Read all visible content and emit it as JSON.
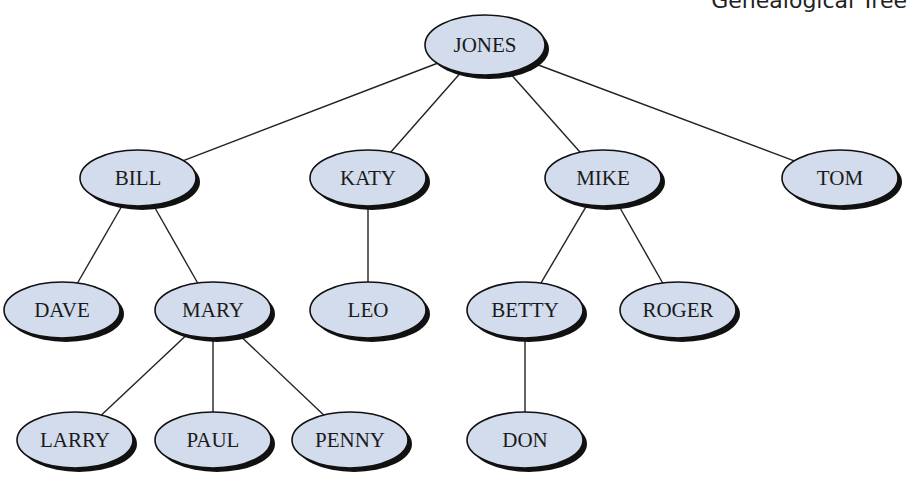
{
  "caption": "Genealogical Tree",
  "style": {
    "node_fill": "#d3dcec",
    "node_stroke": "#111111",
    "shadow": "#111111",
    "edge": "#222222"
  },
  "nodes": [
    {
      "id": "jones",
      "label": "JONES",
      "x": 485,
      "y": 45,
      "rx": 60,
      "ry": 30
    },
    {
      "id": "bill",
      "label": "BILL",
      "x": 138,
      "y": 178,
      "rx": 58,
      "ry": 28
    },
    {
      "id": "katy",
      "label": "KATY",
      "x": 368,
      "y": 178,
      "rx": 58,
      "ry": 28
    },
    {
      "id": "mike",
      "label": "MIKE",
      "x": 603,
      "y": 178,
      "rx": 58,
      "ry": 28
    },
    {
      "id": "tom",
      "label": "TOM",
      "x": 840,
      "y": 178,
      "rx": 58,
      "ry": 28
    },
    {
      "id": "dave",
      "label": "DAVE",
      "x": 62,
      "y": 310,
      "rx": 58,
      "ry": 28
    },
    {
      "id": "mary",
      "label": "MARY",
      "x": 213,
      "y": 310,
      "rx": 58,
      "ry": 28
    },
    {
      "id": "leo",
      "label": "LEO",
      "x": 368,
      "y": 310,
      "rx": 58,
      "ry": 28
    },
    {
      "id": "betty",
      "label": "BETTY",
      "x": 525,
      "y": 310,
      "rx": 58,
      "ry": 28
    },
    {
      "id": "roger",
      "label": "ROGER",
      "x": 678,
      "y": 310,
      "rx": 58,
      "ry": 28
    },
    {
      "id": "larry",
      "label": "LARRY",
      "x": 75,
      "y": 440,
      "rx": 58,
      "ry": 28
    },
    {
      "id": "paul",
      "label": "PAUL",
      "x": 213,
      "y": 440,
      "rx": 58,
      "ry": 28
    },
    {
      "id": "penny",
      "label": "PENNY",
      "x": 350,
      "y": 440,
      "rx": 58,
      "ry": 28
    },
    {
      "id": "don",
      "label": "DON",
      "x": 525,
      "y": 440,
      "rx": 58,
      "ry": 28
    }
  ],
  "edges": [
    [
      "jones",
      "bill"
    ],
    [
      "jones",
      "katy"
    ],
    [
      "jones",
      "mike"
    ],
    [
      "jones",
      "tom"
    ],
    [
      "bill",
      "dave"
    ],
    [
      "bill",
      "mary"
    ],
    [
      "katy",
      "leo"
    ],
    [
      "mike",
      "betty"
    ],
    [
      "mike",
      "roger"
    ],
    [
      "mary",
      "larry"
    ],
    [
      "mary",
      "paul"
    ],
    [
      "mary",
      "penny"
    ],
    [
      "betty",
      "don"
    ]
  ]
}
